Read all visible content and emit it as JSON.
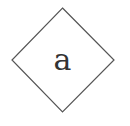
{
  "diagram": {
    "shape": "diamond",
    "label": "a",
    "stroke_color": "#555555",
    "text_color": "#333333",
    "background": "#ffffff"
  }
}
